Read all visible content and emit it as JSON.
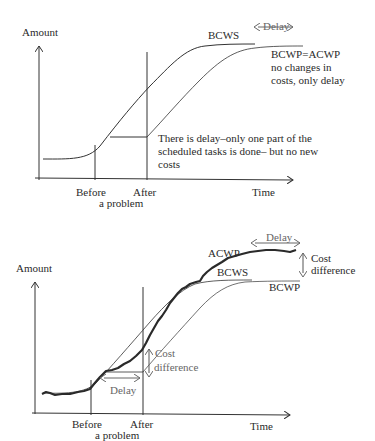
{
  "top_chart": {
    "y_label": "Amount",
    "x_label": "Time",
    "before_label": "Before",
    "after_label": "After",
    "problem_label": "a problem",
    "bcws_label": "BCWS",
    "delay_label": "Delay",
    "bcwp_label": "BCWP=ACWP",
    "note_line1": "no changes in",
    "note_line2": "costs, only delay",
    "delay_note_line1": "There is delay–only one part of the",
    "delay_note_line2": "scheduled tasks is done– but no new",
    "delay_note_line3": "costs"
  },
  "bottom_chart": {
    "y_label": "Amount",
    "x_label": "Time",
    "before_label": "Before",
    "after_label": "After",
    "problem_label": "a problem",
    "acwp_label": "ACWP",
    "bcws_label": "BCWS",
    "bcwp_label": "BCWP",
    "delay_top_label": "Delay",
    "cost_diff_top_line1": "Cost",
    "cost_diff_top_line2": "difference",
    "delay_mid_label": "Delay",
    "cost_diff_mid_line1": "Cost",
    "cost_diff_mid_line2": "difference"
  }
}
